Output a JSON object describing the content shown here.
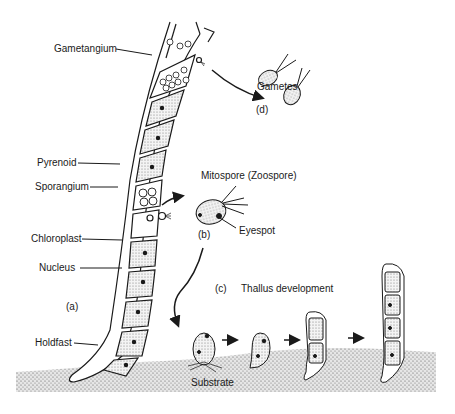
{
  "figure": {
    "colors": {
      "ink": "#1a1a1a",
      "substrate": "#bdbdbd",
      "background": "#ffffff"
    }
  },
  "filament": {
    "panel_label": "(a)",
    "labels": {
      "gametangium": "Gametangium",
      "pyrenoid": "Pyrenoid",
      "sporangium": "Sporangium",
      "chloroplast": "Chloroplast",
      "nucleus": "Nucleus",
      "holdfast": "Holdfast"
    }
  },
  "mitospore": {
    "panel_label": "(b)",
    "title": "Mitospore (Zoospore)",
    "eyespot_label": "Eyespot"
  },
  "thallus": {
    "panel_label": "(c)",
    "title": "Thallus development",
    "substrate_label": "Substrate",
    "stages": [
      "settled zoospore",
      "germinating cell",
      "two-celled thallus",
      "multicellular thallus"
    ]
  },
  "gametes": {
    "panel_label": "(d)",
    "title": "Gametes"
  }
}
